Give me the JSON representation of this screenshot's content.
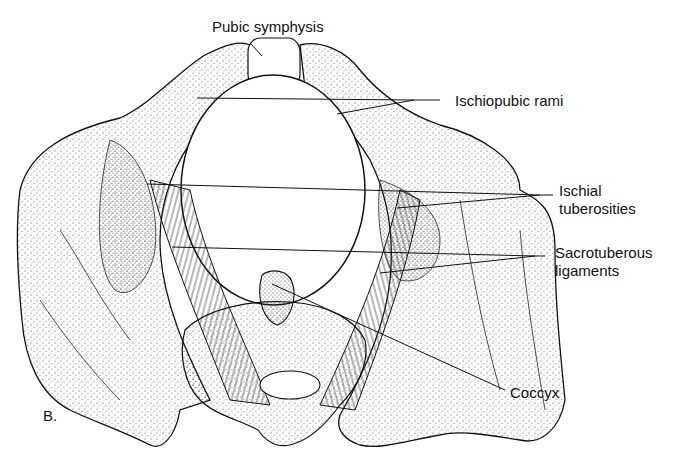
{
  "figure": {
    "panel_letter": "B.",
    "labels": {
      "pubic_symphysis": "Pubic symphysis",
      "ischiopubic_rami": "Ischiopubic rami",
      "ischial_tuberosities_line1": "Ischial",
      "ischial_tuberosities_line2": "tuberosities",
      "sacrotuberous_ligaments_line1": "Sacrotuberous",
      "sacrotuberous_ligaments_line2": "ligaments",
      "coccyx": "Coccyx"
    },
    "colors": {
      "ink": "#111111",
      "background": "#ffffff",
      "stipple": "#555555"
    }
  }
}
